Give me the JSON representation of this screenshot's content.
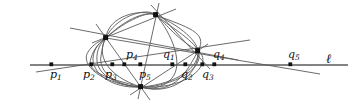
{
  "figure": {
    "kind": "projective-geometry-diagram",
    "background_color": "#ffffff",
    "stroke_color": "#555555",
    "line_color": "#555555",
    "point_color": "#111111",
    "baseline_label": "ℓ",
    "baseline": {
      "name": "line-l",
      "x1": 30,
      "y1": 65,
      "x2": 348,
      "y2": 65,
      "width": 1.6
    },
    "points_on_line": [
      {
        "id": "p1",
        "label": "p",
        "sub": "1",
        "x": 52,
        "y": 65,
        "label_x": 50,
        "label_y": 69
      },
      {
        "id": "p2",
        "label": "p",
        "sub": "2",
        "x": 92,
        "y": 65,
        "label_x": 83,
        "label_y": 69
      },
      {
        "id": "p3",
        "label": "p",
        "sub": "3",
        "x": 113,
        "y": 65,
        "label_x": 105,
        "label_y": 69
      },
      {
        "id": "p4",
        "label": "p",
        "sub": "4",
        "x": 125,
        "y": 65,
        "label_x": 126,
        "label_y": 49
      },
      {
        "id": "p5",
        "label": "p",
        "sub": "5",
        "x": 141,
        "y": 65,
        "label_x": 139,
        "label_y": 69
      },
      {
        "id": "q1",
        "label": "q",
        "sub": "1",
        "x": 173,
        "y": 65,
        "label_x": 163,
        "label_y": 49
      },
      {
        "id": "q2",
        "label": "q",
        "sub": "2",
        "x": 186,
        "y": 65,
        "label_x": 181,
        "label_y": 69
      },
      {
        "id": "q3",
        "label": "q",
        "sub": "3",
        "x": 203,
        "y": 65,
        "label_x": 202,
        "label_y": 69
      },
      {
        "id": "q4",
        "label": "q",
        "sub": "4",
        "x": 215,
        "y": 65,
        "label_x": 213,
        "label_y": 49
      },
      {
        "id": "q5",
        "label": "q",
        "sub": "5",
        "x": 291,
        "y": 65,
        "label_x": 288,
        "label_y": 49
      }
    ],
    "base_points": [
      {
        "id": "node-left",
        "x": 106,
        "y": 38
      },
      {
        "id": "node-top",
        "x": 156,
        "y": 15
      },
      {
        "id": "node-right",
        "x": 198,
        "y": 51
      },
      {
        "id": "node-bottom",
        "x": 141,
        "y": 87
      }
    ],
    "l_label_x": 326,
    "l_label_y": 54
  }
}
